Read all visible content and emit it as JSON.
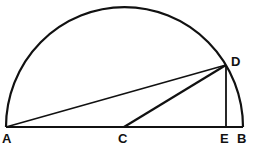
{
  "diagram": {
    "type": "semicircle-geometry",
    "points": {
      "A": {
        "label": "A",
        "x": 6,
        "y": 127
      },
      "B": {
        "label": "B",
        "x": 243,
        "y": 127
      },
      "C": {
        "label": "C",
        "x": 124,
        "y": 127
      },
      "D": {
        "label": "D",
        "x": 226,
        "y": 65
      },
      "E": {
        "label": "E",
        "x": 226,
        "y": 127
      }
    },
    "segments": [
      "AB",
      "AD",
      "CD",
      "DE"
    ],
    "arc": {
      "from": "A",
      "to": "B",
      "center": "C"
    },
    "stroke_color": "#111111"
  },
  "labels": {
    "A": "A",
    "B": "B",
    "C": "C",
    "D": "D",
    "E": "E"
  }
}
